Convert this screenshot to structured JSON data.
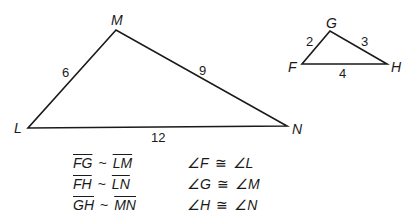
{
  "diagram": {
    "large_triangle": {
      "vertices": {
        "M": {
          "label": "M",
          "x": 116,
          "y": 30
        },
        "L": {
          "label": "L",
          "x": 28,
          "y": 128
        },
        "N": {
          "label": "N",
          "x": 287,
          "y": 126
        }
      },
      "sides": {
        "LM": "6",
        "MN": "9",
        "LN": "12"
      }
    },
    "small_triangle": {
      "vertices": {
        "G": {
          "label": "G",
          "x": 330,
          "y": 31
        },
        "F": {
          "label": "F",
          "x": 302,
          "y": 64
        },
        "H": {
          "label": "H",
          "x": 387,
          "y": 64
        }
      },
      "sides": {
        "FG": "2",
        "GH": "3",
        "FH": "4"
      }
    },
    "side_relations": [
      {
        "left": "FG",
        "symbol": "~",
        "right": "LM"
      },
      {
        "left": "FH",
        "symbol": "~",
        "right": "LN"
      },
      {
        "left": "GH",
        "symbol": "~",
        "right": "MN"
      }
    ],
    "angle_relations": [
      {
        "left": "∠F",
        "symbol": "≅",
        "right": "∠L"
      },
      {
        "left": "∠G",
        "symbol": "≅",
        "right": "∠M"
      },
      {
        "left": "∠H",
        "symbol": "≅",
        "right": "∠N"
      }
    ],
    "colors": {
      "line": "#1a1a1a",
      "background": "#ffffff"
    }
  }
}
